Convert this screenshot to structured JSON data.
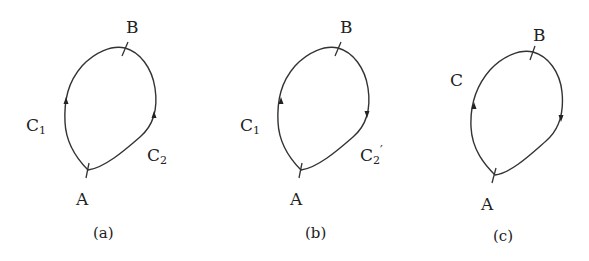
{
  "figure": {
    "panels": [
      {
        "id": "a",
        "caption": "(a)",
        "points": {
          "start": "A",
          "end": "B"
        },
        "curves": [
          {
            "label": "C",
            "subscript": "1",
            "prime": "",
            "direction": "A to B (upward on left)"
          },
          {
            "label": "C",
            "subscript": "2",
            "prime": "",
            "direction": "A to B (upward on right)"
          }
        ]
      },
      {
        "id": "b",
        "caption": "(b)",
        "points": {
          "start": "A",
          "end": "B"
        },
        "curves": [
          {
            "label": "C",
            "subscript": "1",
            "prime": "",
            "direction": "A to B (upward on left)"
          },
          {
            "label": "C",
            "subscript": "2",
            "prime": "′",
            "direction": "B to A (downward on right)"
          }
        ]
      },
      {
        "id": "c",
        "caption": "(c)",
        "points": {
          "start": "A",
          "end": "B"
        },
        "curves": [
          {
            "label": "C",
            "subscript": "",
            "prime": "",
            "direction": "closed loop, counter-clockwise"
          }
        ]
      }
    ],
    "colors": {
      "stroke": "#333333",
      "text": "#222222",
      "background": "#ffffff"
    }
  }
}
